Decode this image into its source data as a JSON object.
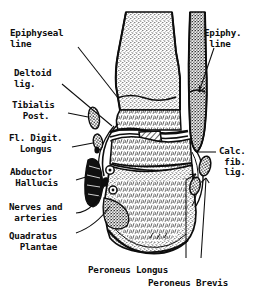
{
  "figure": {
    "style": "engraved line drawing, stippled bone texture, hand-lettered labels",
    "background_color": "#ffffff",
    "ink_color": "#0d0d0d"
  },
  "labels": {
    "left": [
      {
        "id": "epiphyseal-line",
        "text": "Epiphyseal\nline",
        "x": 10,
        "y": 28,
        "align": "left"
      },
      {
        "id": "deltoid-lig",
        "text": "Deltoid\nlig.",
        "x": 14,
        "y": 68,
        "align": "left"
      },
      {
        "id": "tibialis-post",
        "text": "Tibialis\n  Post.",
        "x": 12,
        "y": 100,
        "align": "left"
      },
      {
        "id": "fl-digit-longus",
        "text": "Fl. Digit.\n  Longus",
        "x": 9,
        "y": 133,
        "align": "left"
      },
      {
        "id": "abductor-hallucis",
        "text": "Abductor\n Hallucis",
        "x": 10,
        "y": 167,
        "align": "left"
      },
      {
        "id": "nerves-and-arteries",
        "text": "Nerves and\n arteries",
        "x": 9,
        "y": 202,
        "align": "left"
      },
      {
        "id": "quadratus-plantae",
        "text": "Quadratus\n  Plantae",
        "x": 9,
        "y": 231,
        "align": "left"
      }
    ],
    "right": [
      {
        "id": "epiphy-line",
        "text": "Epiphy.\n line",
        "x": 204,
        "y": 28,
        "align": "left"
      },
      {
        "id": "calc-fib-lig",
        "text": "Calc.\n fib.\n lig.",
        "x": 219,
        "y": 146,
        "align": "left"
      }
    ],
    "bottom": [
      {
        "id": "peroneus-longus",
        "text": "Peroneus Longus",
        "x": 88,
        "y": 265,
        "align": "left"
      },
      {
        "id": "peroneus-brevis",
        "text": "Peroneus Brevis",
        "x": 148,
        "y": 278,
        "align": "left"
      }
    ]
  },
  "anatomy": {
    "bones": [
      "tibia",
      "fibula",
      "talus",
      "calcaneus"
    ],
    "soft_tissue": [
      "deltoid ligament",
      "calcaneofibular ligament",
      "tendons",
      "nerves and arteries"
    ]
  }
}
